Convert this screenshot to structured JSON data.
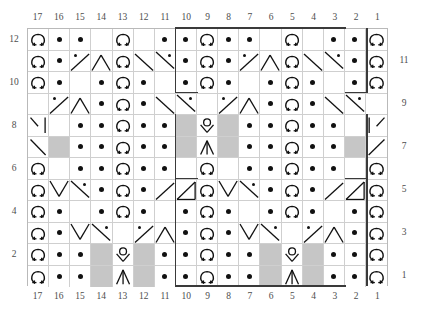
{
  "chart": {
    "type": "knitting-chart",
    "columns": 17,
    "rows": 12,
    "column_labels_top": [
      "17",
      "16",
      "15",
      "14",
      "13",
      "12",
      "11",
      "10",
      "9",
      "8",
      "7",
      "6",
      "5",
      "4",
      "3",
      "2",
      "1"
    ],
    "column_labels_bottom": [
      "17",
      "16",
      "15",
      "14",
      "13",
      "12",
      "11",
      "10",
      "9",
      "8",
      "7",
      "6",
      "5",
      "4",
      "3",
      "2",
      "1"
    ],
    "row_labels_left": [
      "12",
      "10",
      "8",
      "6",
      "4",
      "2"
    ],
    "row_labels_right": [
      "11",
      "9",
      "7",
      "5",
      "3",
      "1"
    ],
    "row_label_rows_left": [
      12,
      10,
      8,
      6,
      4,
      2
    ],
    "row_label_rows_right": [
      11,
      9,
      7,
      5,
      3,
      1
    ],
    "legend_colors": {
      "cell_background": "#ffffff",
      "no_stitch_background": "#c6c6c6",
      "grid_line": "#cfcfcf",
      "border": "#b9b9b9",
      "symbol_ink": "#111111",
      "repeat_box": "#3a3a3a",
      "label_text": "#4d4d4d"
    },
    "symbol_names": {
      "blank": "knit",
      "dot": "purl",
      "omega": "yarn-over-omega",
      "nostitch": "no-stitch",
      "ctr_dec": "central-double-decrease",
      "yo_dec": "yarn-over-over-decrease",
      "lt_hook": "left-twist-hook",
      "rt_hook": "right-twist-hook",
      "diag_bs": "diagonal-backslash",
      "diag_fs": "diagonal-slash",
      "cbl_l_up": "cable-left-up",
      "cbl_r_up": "cable-right-up",
      "cbl_l_dn": "cable-left-down",
      "cbl_r_dn": "cable-right-down",
      "cbl_peak": "cable-peak",
      "cbl_valley": "cable-valley",
      "cbl_tri_l": "cable-triangle-left",
      "cbl_tri_r": "cable-triangle-right"
    },
    "rows_data": [
      {
        "row": 12,
        "cells": [
          "omega",
          "dot",
          "dot",
          "blank",
          "omega",
          "blank",
          "dot",
          "dot",
          "omega",
          "dot",
          "dot",
          "blank",
          "omega",
          "blank",
          "dot",
          "dot",
          "omega"
        ]
      },
      {
        "row": 11,
        "cells": [
          "omega",
          "dot",
          "cbl_l_up",
          "cbl_peak",
          "omega",
          "cbl_valley",
          "cbl_r_up",
          "dot",
          "omega",
          "dot",
          "cbl_l_up",
          "cbl_peak",
          "omega",
          "cbl_valley",
          "cbl_r_up",
          "dot",
          "omega"
        ]
      },
      {
        "row": 10,
        "cells": [
          "omega",
          "dot",
          "blank",
          "dot",
          "omega",
          "dot",
          "blank",
          "dot",
          "omega",
          "dot",
          "blank",
          "dot",
          "omega",
          "dot",
          "blank",
          "dot",
          "omega"
        ]
      },
      {
        "row": 9,
        "cells": [
          "blank",
          "cbl_l_up",
          "cbl_peak",
          "dot",
          "omega",
          "dot",
          "cbl_valley",
          "cbl_r_up",
          "blank",
          "cbl_l_up",
          "cbl_peak",
          "dot",
          "omega",
          "dot",
          "cbl_valley",
          "cbl_r_up",
          "blank"
        ]
      },
      {
        "row": 8,
        "cells": [
          "lt_hook",
          "blank",
          "dot",
          "dot",
          "omega",
          "dot",
          "dot",
          "nostitch",
          "yo_dec",
          "nostitch",
          "dot",
          "dot",
          "omega",
          "dot",
          "dot",
          "blank",
          "rt_hook"
        ]
      },
      {
        "row": 7,
        "cells": [
          "diag_bs",
          "nostitch",
          "dot",
          "dot",
          "omega",
          "dot",
          "dot",
          "nostitch",
          "ctr_dec",
          "nostitch",
          "dot",
          "dot",
          "omega",
          "dot",
          "dot",
          "nostitch",
          "diag_fs"
        ]
      },
      {
        "row": 6,
        "cells": [
          "omega",
          "blank",
          "dot",
          "dot",
          "omega",
          "dot",
          "dot",
          "blank",
          "omega",
          "blank",
          "dot",
          "dot",
          "omega",
          "dot",
          "dot",
          "blank",
          "omega"
        ]
      },
      {
        "row": 5,
        "cells": [
          "omega",
          "cbl_valley",
          "cbl_r_dn",
          "dot",
          "omega",
          "dot",
          "cbl_l_dn",
          "cbl_tri_r",
          "omega",
          "cbl_valley",
          "cbl_r_dn",
          "dot",
          "omega",
          "dot",
          "cbl_l_dn",
          "cbl_tri_r",
          "omega"
        ]
      },
      {
        "row": 4,
        "cells": [
          "omega",
          "dot",
          "blank",
          "dot",
          "omega",
          "dot",
          "blank",
          "dot",
          "omega",
          "dot",
          "blank",
          "dot",
          "omega",
          "dot",
          "blank",
          "dot",
          "omega"
        ]
      },
      {
        "row": 3,
        "cells": [
          "omega",
          "dot",
          "cbl_valley",
          "cbl_r_dn",
          "blank",
          "cbl_l_dn",
          "cbl_peak",
          "dot",
          "omega",
          "dot",
          "cbl_valley",
          "cbl_r_dn",
          "blank",
          "cbl_l_dn",
          "cbl_peak",
          "dot",
          "omega"
        ]
      },
      {
        "row": 2,
        "cells": [
          "omega",
          "dot",
          "dot",
          "nostitch",
          "yo_dec",
          "nostitch",
          "dot",
          "dot",
          "omega",
          "dot",
          "dot",
          "nostitch",
          "yo_dec",
          "nostitch",
          "dot",
          "dot",
          "omega"
        ]
      },
      {
        "row": 1,
        "cells": [
          "omega",
          "dot",
          "dot",
          "nostitch",
          "ctr_dec",
          "nostitch",
          "dot",
          "dot",
          "omega",
          "dot",
          "dot",
          "nostitch",
          "ctr_dec",
          "nostitch",
          "dot",
          "dot",
          "omega"
        ]
      }
    ],
    "repeat_box": {
      "label": "pattern repeat outline",
      "left_column": 10,
      "right_column": 2
    }
  }
}
